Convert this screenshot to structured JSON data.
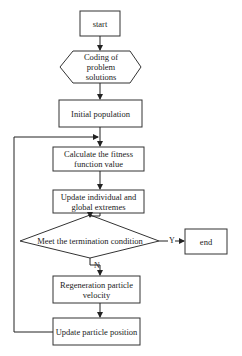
{
  "diagram": {
    "type": "flowchart",
    "nodes": {
      "start": {
        "label": "start",
        "shape": "rectangle"
      },
      "coding": {
        "label": "Coding of problem solutions",
        "shape": "hexagon"
      },
      "init": {
        "label": "Initial population",
        "shape": "rectangle"
      },
      "fitness": {
        "label": "Calculate the fitness function value",
        "shape": "rectangle"
      },
      "update_extremes": {
        "label": "Update individual and global extremes",
        "shape": "rectangle"
      },
      "decision": {
        "label": "Meet the termination condition",
        "shape": "diamond"
      },
      "end": {
        "label": "end",
        "shape": "rectangle"
      },
      "velocity": {
        "label": "Regeneration particle velocity",
        "shape": "rectangle"
      },
      "position": {
        "label": "Update particle position",
        "shape": "rectangle"
      }
    },
    "edges": {
      "yes_label": "Y",
      "no_label": "N"
    },
    "colors": {
      "stroke": "#333333",
      "background": "#ffffff",
      "text": "#222222"
    }
  }
}
